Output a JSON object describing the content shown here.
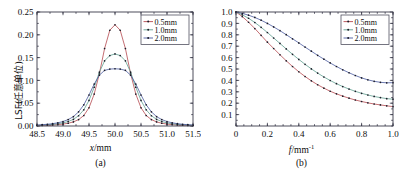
{
  "figure": {
    "panels": [
      {
        "caption": "(a)",
        "ylabel": "LSF(任意单位)",
        "xlabel_italic": "x",
        "xlabel_rest": "/mm",
        "xlabel_sup": ""
      },
      {
        "caption": "(b)",
        "ylabel": "MTF",
        "xlabel_italic": "f",
        "xlabel_rest": "/mm",
        "xlabel_sup": "-1"
      }
    ]
  },
  "chart_data": [
    {
      "type": "line",
      "panel": "a",
      "title": "",
      "xlabel": "x/mm",
      "ylabel": "LSF(任意单位)",
      "xlim": [
        48.5,
        51.5
      ],
      "ylim": [
        0.0,
        0.25
      ],
      "xticks": [
        48.5,
        49.0,
        49.5,
        50.0,
        50.5,
        51.0,
        51.5
      ],
      "xtick_labels": [
        "48.5",
        "49.0",
        "49.5",
        "50.0",
        "50.5",
        "51.0",
        "51.5"
      ],
      "yticks": [
        0.0,
        0.05,
        0.1,
        0.15,
        0.2,
        0.25
      ],
      "ytick_labels": [
        "0.00",
        "0.05",
        "0.10",
        "0.15",
        "0.20",
        "0.25"
      ],
      "grid": false,
      "legend_position": "top-right",
      "markers": true,
      "series": [
        {
          "name": "0.5mm",
          "color": "#b5494f",
          "x": [
            48.5,
            48.6,
            48.7,
            48.8,
            48.9,
            49.0,
            49.1,
            49.2,
            49.3,
            49.4,
            49.5,
            49.6,
            49.7,
            49.8,
            49.9,
            50.0,
            50.1,
            50.2,
            50.3,
            50.4,
            50.5,
            50.6,
            50.7,
            50.8,
            50.9,
            51.0,
            51.1,
            51.2,
            51.3,
            51.4,
            51.5
          ],
          "values": [
            0.001,
            0.0013,
            0.0017,
            0.0022,
            0.003,
            0.0042,
            0.006,
            0.009,
            0.014,
            0.023,
            0.04,
            0.07,
            0.115,
            0.17,
            0.21,
            0.222,
            0.21,
            0.17,
            0.115,
            0.07,
            0.04,
            0.023,
            0.014,
            0.009,
            0.006,
            0.0042,
            0.003,
            0.0022,
            0.0017,
            0.0013,
            0.001
          ]
        },
        {
          "name": "1.0mm",
          "color": "#5f9e8f",
          "x": [
            48.5,
            48.6,
            48.7,
            48.8,
            48.9,
            49.0,
            49.1,
            49.2,
            49.3,
            49.4,
            49.5,
            49.6,
            49.7,
            49.8,
            49.9,
            50.0,
            50.1,
            50.2,
            50.3,
            50.4,
            50.5,
            50.6,
            50.7,
            50.8,
            50.9,
            51.0,
            51.1,
            51.2,
            51.3,
            51.4,
            51.5
          ],
          "values": [
            0.0015,
            0.002,
            0.0026,
            0.0035,
            0.0048,
            0.0068,
            0.0098,
            0.0145,
            0.0225,
            0.0355,
            0.056,
            0.085,
            0.118,
            0.143,
            0.1545,
            0.158,
            0.1545,
            0.143,
            0.118,
            0.085,
            0.056,
            0.0355,
            0.0225,
            0.0145,
            0.0098,
            0.0068,
            0.0048,
            0.0035,
            0.0026,
            0.002,
            0.0015
          ]
        },
        {
          "name": "2.0mm",
          "color": "#4a5a9e",
          "x": [
            48.5,
            48.6,
            48.7,
            48.8,
            48.9,
            49.0,
            49.1,
            49.2,
            49.3,
            49.4,
            49.5,
            49.6,
            49.7,
            49.8,
            49.9,
            50.0,
            50.1,
            50.2,
            50.3,
            50.4,
            50.5,
            50.6,
            50.7,
            50.8,
            50.9,
            51.0,
            51.1,
            51.2,
            51.3,
            51.4,
            51.5
          ],
          "values": [
            0.0022,
            0.0029,
            0.0038,
            0.0051,
            0.007,
            0.0098,
            0.014,
            0.0205,
            0.031,
            0.0465,
            0.068,
            0.092,
            0.1115,
            0.122,
            0.1248,
            0.1255,
            0.1248,
            0.122,
            0.1115,
            0.092,
            0.068,
            0.0465,
            0.031,
            0.0205,
            0.014,
            0.0098,
            0.007,
            0.0051,
            0.0038,
            0.0029,
            0.0022
          ]
        }
      ]
    },
    {
      "type": "line",
      "panel": "b",
      "title": "",
      "xlabel": "f/mm-1",
      "ylabel": "MTF",
      "xlim": [
        0.0,
        1.0
      ],
      "ylim": [
        0.0,
        1.0
      ],
      "xticks": [
        0.0,
        0.2,
        0.4,
        0.6,
        0.8,
        1.0
      ],
      "xtick_labels": [
        "0",
        "0.2",
        "0.4",
        "0.6",
        "0.8",
        "1.0"
      ],
      "yticks": [
        0.1,
        0.2,
        0.3,
        0.4,
        0.5,
        0.6,
        0.7,
        0.8,
        0.9,
        1.0
      ],
      "ytick_labels": [
        "0.1",
        "0.2",
        "0.3",
        "0.4",
        "0.5",
        "0.6",
        "0.7",
        "0.8",
        "0.9",
        "1.0"
      ],
      "grid": false,
      "legend_position": "top-right",
      "markers": true,
      "series": [
        {
          "name": "0.5mm",
          "color": "#b5494f",
          "x": [
            0.0,
            0.04,
            0.08,
            0.12,
            0.16,
            0.2,
            0.24,
            0.28,
            0.32,
            0.36,
            0.4,
            0.44,
            0.48,
            0.52,
            0.56,
            0.6,
            0.64,
            0.68,
            0.72,
            0.76,
            0.8,
            0.84,
            0.88,
            0.92,
            0.96,
            1.0
          ],
          "values": [
            1.0,
            0.96,
            0.91,
            0.855,
            0.795,
            0.735,
            0.68,
            0.625,
            0.572,
            0.522,
            0.476,
            0.434,
            0.396,
            0.362,
            0.332,
            0.305,
            0.282,
            0.262,
            0.244,
            0.228,
            0.215,
            0.203,
            0.193,
            0.185,
            0.177,
            0.17
          ]
        },
        {
          "name": "1.0mm",
          "color": "#5f9e8f",
          "x": [
            0.0,
            0.04,
            0.08,
            0.12,
            0.16,
            0.2,
            0.24,
            0.28,
            0.32,
            0.36,
            0.4,
            0.44,
            0.48,
            0.52,
            0.56,
            0.6,
            0.64,
            0.68,
            0.72,
            0.76,
            0.8,
            0.84,
            0.88,
            0.92,
            0.96,
            1.0
          ],
          "values": [
            1.0,
            0.975,
            0.945,
            0.908,
            0.866,
            0.82,
            0.772,
            0.724,
            0.676,
            0.629,
            0.584,
            0.541,
            0.501,
            0.464,
            0.43,
            0.399,
            0.371,
            0.346,
            0.324,
            0.304,
            0.287,
            0.272,
            0.259,
            0.249,
            0.24,
            0.235
          ]
        },
        {
          "name": "2.0mm",
          "color": "#4a5a9e",
          "x": [
            0.0,
            0.04,
            0.08,
            0.12,
            0.16,
            0.2,
            0.24,
            0.28,
            0.32,
            0.36,
            0.4,
            0.44,
            0.48,
            0.52,
            0.56,
            0.6,
            0.64,
            0.68,
            0.72,
            0.76,
            0.8,
            0.84,
            0.88,
            0.92,
            0.96,
            1.0
          ],
          "values": [
            1.0,
            0.988,
            0.972,
            0.952,
            0.928,
            0.9,
            0.869,
            0.836,
            0.801,
            0.765,
            0.729,
            0.692,
            0.656,
            0.62,
            0.586,
            0.553,
            0.522,
            0.493,
            0.467,
            0.443,
            0.422,
            0.405,
            0.392,
            0.383,
            0.379,
            0.38
          ]
        }
      ]
    }
  ],
  "legends": {
    "panel_a": [
      {
        "label": "0.5mm",
        "color": "#b5494f"
      },
      {
        "label": "1.0mm",
        "color": "#5f9e8f"
      },
      {
        "label": "2.0mm",
        "color": "#4a5a9e"
      }
    ],
    "panel_b": [
      {
        "label": "0.5mm",
        "color": "#b5494f"
      },
      {
        "label": "1.0mm",
        "color": "#5f9e8f"
      },
      {
        "label": "2.0mm",
        "color": "#4a5a9e"
      }
    ]
  }
}
